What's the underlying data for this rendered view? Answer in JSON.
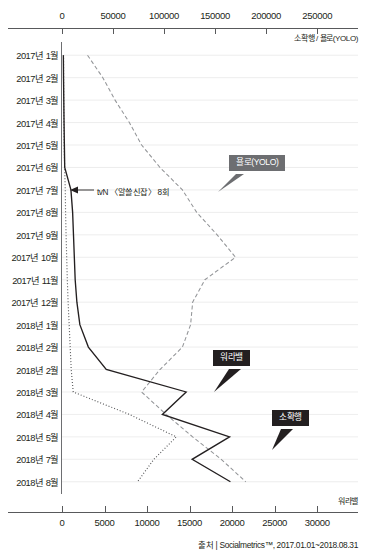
{
  "chart_data": {
    "type": "line",
    "orientation": "horizontal",
    "title": "",
    "source": "출처 | Socialmetrics™, 2017.01.01~2018.08.31",
    "categories": [
      "2017년  1월",
      "2017년  2월",
      "2017년  3월",
      "2017년  4월",
      "2017년  5월",
      "2017년  6월",
      "2017년  7월",
      "2017년  8월",
      "2017년  9월",
      "2017년 10월",
      "2017년 11월",
      "2017년 12월",
      "2018년  1월",
      "2018년  2월",
      "2018년  2월",
      "2018년  3월",
      "2018년  4월",
      "2018년  5월",
      "2018년  7월",
      "2018년  8월"
    ],
    "top_axis": {
      "label": "소확행 / 욜로(YOLO)",
      "ticks": [
        0,
        50000,
        100000,
        150000,
        200000,
        250000
      ],
      "tick_labels": [
        "0",
        "50000",
        "100000",
        "150000",
        "200000",
        "250000"
      ],
      "min": 0,
      "max": 290000
    },
    "bottom_axis": {
      "label": "워라밸",
      "ticks": [
        0,
        5000,
        10000,
        15000,
        20000,
        25000,
        30000
      ],
      "tick_labels": [
        "0",
        "5000",
        "10000",
        "15000",
        "20000",
        "25000",
        "30000"
      ],
      "min": 0,
      "max": 34800
    },
    "grid": "horizontal",
    "legend_position": "inline-callouts",
    "series": [
      {
        "name": "욜로(YOLO)",
        "axis": "top",
        "style": "dashed",
        "color": "#939598",
        "values": [
          25000,
          40000,
          52000,
          66000,
          78000,
          96000,
          118000,
          132000,
          152000,
          170000,
          140000,
          128000,
          126000,
          118000,
          96000,
          78000,
          102000,
          128000,
          156000,
          180000
        ]
      },
      {
        "name": "소확행",
        "axis": "top",
        "style": "dotted",
        "color": "#58595b",
        "values": [
          1500,
          1600,
          1700,
          1900,
          2100,
          2600,
          3200,
          3500,
          4000,
          4600,
          5200,
          6000,
          7000,
          8000,
          9000,
          11000,
          66000,
          112000,
          90000,
          74000
        ]
      },
      {
        "name": "워라밸",
        "axis": "bottom",
        "style": "solid",
        "color": "#231f20",
        "values": [
          160,
          180,
          210,
          240,
          280,
          320,
          1050,
          1250,
          1350,
          1450,
          1550,
          1750,
          2100,
          3100,
          5200,
          14600,
          11800,
          19700,
          15300,
          19800
        ]
      }
    ],
    "annotations": [
      {
        "text": "tvN 〈알쓸신잡〉 8회",
        "target_category": "2017년  7월"
      }
    ],
    "callouts": [
      {
        "label": "욜로(YOLO)",
        "tone": "gray"
      },
      {
        "label": "워라밸",
        "tone": "black"
      },
      {
        "label": "소확행",
        "tone": "black"
      }
    ],
    "colors": {
      "axis": "#58595b",
      "grid": "#e8e8e8",
      "text": "#231f20",
      "callout_gray": "#6d6e71",
      "callout_black": "#231f20"
    }
  }
}
